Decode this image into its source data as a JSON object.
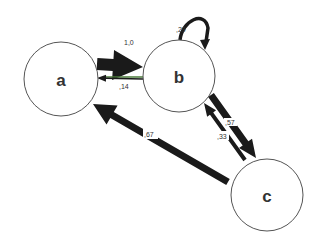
{
  "diagram": {
    "type": "state-transition-graph",
    "nodes": [
      {
        "id": "a",
        "label": "a"
      },
      {
        "id": "b",
        "label": "b"
      },
      {
        "id": "c",
        "label": "c"
      }
    ],
    "edges": [
      {
        "id": "a-b",
        "from": "a",
        "to": "b",
        "label": "1,0",
        "weight": 1.0
      },
      {
        "id": "b-a",
        "from": "b",
        "to": "a",
        "label": ",14",
        "weight": 0.14
      },
      {
        "id": "b-b",
        "from": "b",
        "to": "b",
        "label": ",29",
        "weight": 0.29
      },
      {
        "id": "b-c",
        "from": "b",
        "to": "c",
        "label": ",57",
        "weight": 0.57
      },
      {
        "id": "c-b",
        "from": "c",
        "to": "b",
        "label": ",33",
        "weight": 0.33
      },
      {
        "id": "c-a",
        "from": "c",
        "to": "a",
        "label": ",67",
        "weight": 0.67
      }
    ],
    "colors": {
      "edge": "#1a1a1a",
      "thin_edge_accent": "#4a7a3a",
      "node_stroke": "#555555",
      "node_fill": "#ffffff"
    }
  }
}
